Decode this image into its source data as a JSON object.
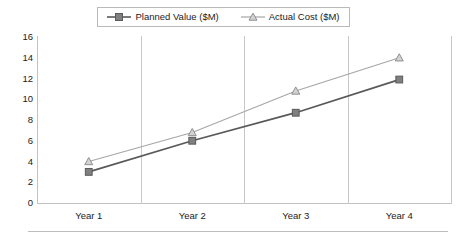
{
  "chart_data": {
    "type": "line",
    "title": "",
    "xlabel": "",
    "ylabel": "",
    "categories": [
      "Year 1",
      "Year 2",
      "Year 3",
      "Year 4"
    ],
    "ylim": [
      0,
      16
    ],
    "yticks": [
      0,
      2,
      4,
      6,
      8,
      10,
      12,
      14,
      16
    ],
    "grid": "vertical-category-separators",
    "legend_position": "top-center",
    "series": [
      {
        "name": "Planned Value ($M)",
        "values": [
          3,
          6,
          8.7,
          11.9
        ],
        "color": "#595959",
        "marker": "square"
      },
      {
        "name": "Actual Cost ($M)",
        "values": [
          4,
          6.8,
          10.8,
          14
        ],
        "color": "#a6a6a6",
        "marker": "triangle"
      }
    ]
  },
  "legend": {
    "entries": [
      {
        "label": "Planned Value ($M)"
      },
      {
        "label": "Actual Cost ($M)"
      }
    ]
  },
  "colors": {
    "planned": "#595959",
    "actual": "#a6a6a6",
    "axis": "#c2c2c2",
    "grid": "#c8c8c8",
    "text": "#1b1b1b",
    "background": "#ffffff"
  }
}
